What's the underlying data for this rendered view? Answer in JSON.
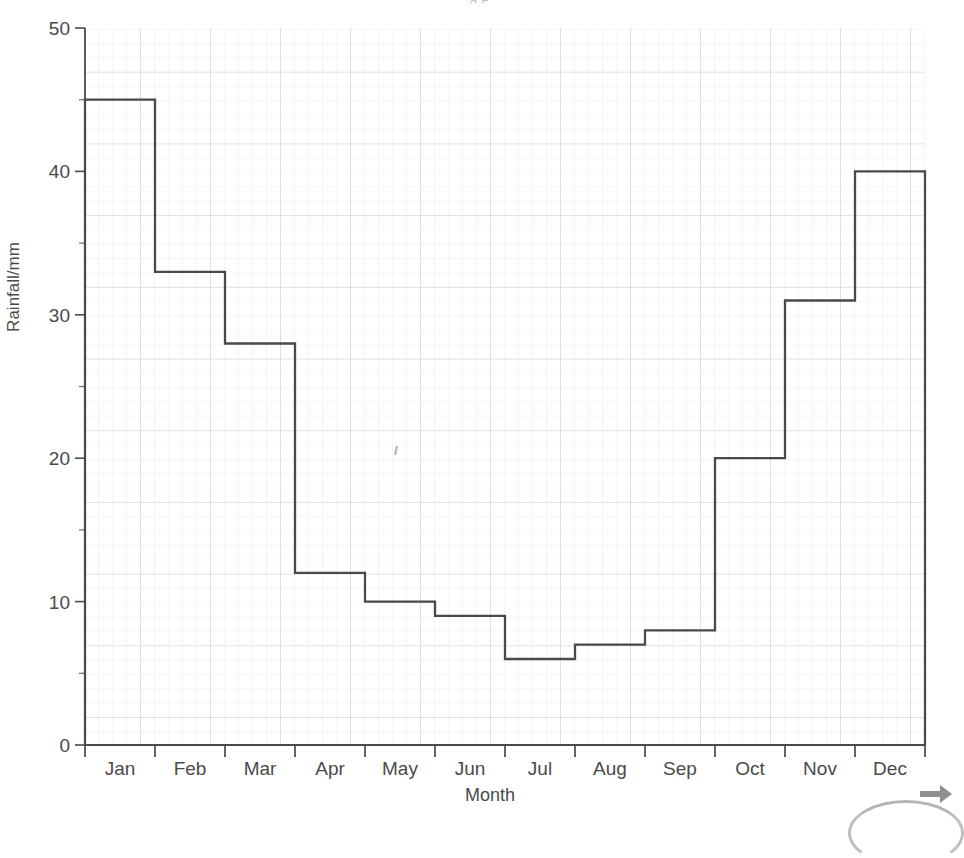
{
  "cropped_title_text": "g  p",
  "chart_data": {
    "type": "bar",
    "title": "",
    "xlabel": "Month",
    "ylabel": "Rainfall/mm",
    "categories": [
      "Jan",
      "Feb",
      "Mar",
      "Apr",
      "May",
      "Jun",
      "Jul",
      "Aug",
      "Sep",
      "Oct",
      "Nov",
      "Dec"
    ],
    "values": [
      45,
      33,
      28,
      12,
      10,
      9,
      6,
      7,
      8,
      20,
      31,
      40
    ],
    "xlim": [
      0,
      12
    ],
    "ylim": [
      0,
      50
    ],
    "y_ticks": [
      0,
      10,
      20,
      30,
      40,
      50
    ],
    "y_tick_labels": [
      "0",
      "10",
      "20",
      "30",
      "40",
      "50"
    ],
    "y_minor_tick_step": 5,
    "grid": true,
    "grid_style": "graph-paper-minor-and-major",
    "legend": null,
    "legend_position": "none",
    "style": "hand-drawn outline bars on graph paper, no fill",
    "line_color": "#4a4a4a",
    "major_grid_color": "#c9c9c9",
    "minor_grid_color": "#e9e9e9",
    "axis_color": "#4a4a4a"
  },
  "artifacts": {
    "arrow_icon": "arrow-right-icon",
    "arc": "partial-circle-arc",
    "pencil_mark": "stray-pencil-mark"
  }
}
